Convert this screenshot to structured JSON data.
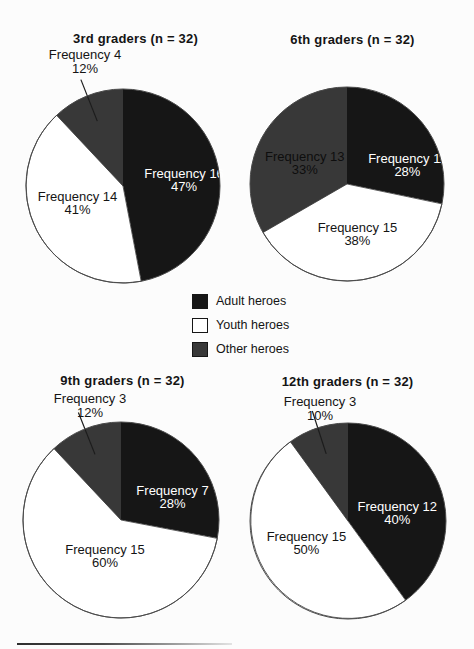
{
  "page": {
    "background": "#fcfcfc"
  },
  "colors": {
    "adult": "#161616",
    "youth": "#ffffff",
    "other": "#383838",
    "outline": "#4a4a4a",
    "ink": "#141414",
    "label_on_adult": "#ffffff",
    "label_on_youth": "#141414",
    "label_on_other": "#0e0e0e"
  },
  "legend": {
    "position": "center-between-rows",
    "items": [
      {
        "label": "Adult heroes",
        "color_key": "adult"
      },
      {
        "label": "Youth heroes",
        "color_key": "youth"
      },
      {
        "label": "Other heroes",
        "color_key": "other"
      }
    ]
  },
  "chart_data": [
    {
      "type": "pie",
      "title": "3rd graders (n = 32)",
      "n": 32,
      "start_angle": "top",
      "direction": "clockwise",
      "slices": [
        {
          "category": "Adult heroes",
          "frequency": 16,
          "percent": 47,
          "label": "Frequency 16",
          "pct_label": "47%",
          "color_key": "adult",
          "label_placement": "inside"
        },
        {
          "category": "Youth heroes",
          "frequency": 14,
          "percent": 41,
          "label": "Frequency 14",
          "pct_label": "41%",
          "color_key": "youth",
          "label_placement": "inside"
        },
        {
          "category": "Other heroes",
          "frequency": 4,
          "percent": 12,
          "label": "Frequency 4",
          "pct_label": "12%",
          "color_key": "other",
          "label_placement": "outside"
        }
      ]
    },
    {
      "type": "pie",
      "title": "6th graders (n = 32)",
      "n": 32,
      "start_angle": "top",
      "direction": "clockwise",
      "slices": [
        {
          "category": "Adult heroes",
          "frequency": 11,
          "percent": 28,
          "label": "Frequency 11",
          "pct_label": "28%",
          "color_key": "adult",
          "label_placement": "inside"
        },
        {
          "category": "Youth heroes",
          "frequency": 15,
          "percent": 38,
          "label": "Frequency 15",
          "pct_label": "38%",
          "color_key": "youth",
          "label_placement": "inside"
        },
        {
          "category": "Other heroes",
          "frequency": 13,
          "percent": 33,
          "label": "Frequency 13",
          "pct_label": "33%",
          "color_key": "other",
          "label_placement": "inside"
        }
      ]
    },
    {
      "type": "pie",
      "title": "9th graders (n = 32)",
      "n": 32,
      "start_angle": "top",
      "direction": "clockwise",
      "slices": [
        {
          "category": "Adult heroes",
          "frequency": 7,
          "percent": 28,
          "label": "Frequency 7",
          "pct_label": "28%",
          "color_key": "adult",
          "label_placement": "inside"
        },
        {
          "category": "Youth heroes",
          "frequency": 15,
          "percent": 60,
          "label": "Frequency 15",
          "pct_label": "60%",
          "color_key": "youth",
          "label_placement": "inside"
        },
        {
          "category": "Other heroes",
          "frequency": 3,
          "percent": 12,
          "label": "Frequency 3",
          "pct_label": "12%",
          "color_key": "other",
          "label_placement": "outside"
        }
      ]
    },
    {
      "type": "pie",
      "title": "12th graders (n = 32)",
      "n": 32,
      "start_angle": "top",
      "direction": "clockwise",
      "slices": [
        {
          "category": "Adult heroes",
          "frequency": 12,
          "percent": 40,
          "label": "Frequency 12",
          "pct_label": "40%",
          "color_key": "adult",
          "label_placement": "inside"
        },
        {
          "category": "Youth heroes",
          "frequency": 15,
          "percent": 50,
          "label": "Frequency 15",
          "pct_label": "50%",
          "color_key": "youth",
          "label_placement": "inside"
        },
        {
          "category": "Other heroes",
          "frequency": 3,
          "percent": 10,
          "label": "Frequency 3",
          "pct_label": "10%",
          "color_key": "other",
          "label_placement": "outside"
        }
      ]
    }
  ]
}
